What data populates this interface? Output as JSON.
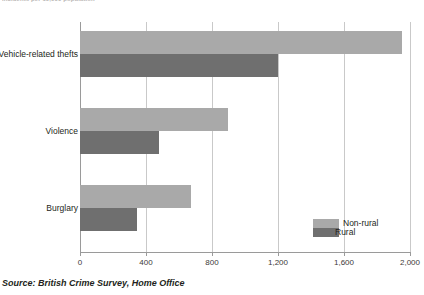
{
  "top_caption": "Incidents per 10,000 population",
  "source": "Source: British Crime Survey, Home Office",
  "legend": {
    "nonrural_label": "Non-rural",
    "rural_label": "Rural",
    "nonrural_color": "#a9a9a9",
    "rural_color": "#6f6f6f"
  },
  "axis": {
    "ticks": [
      "0",
      "400",
      "800",
      "1,200",
      "1,600",
      "2,000"
    ]
  },
  "chart_data": {
    "type": "bar",
    "orientation": "horizontal",
    "title": "",
    "subtitle": "",
    "xlabel": "",
    "ylabel": "",
    "xlim": [
      0,
      2000
    ],
    "xticks": [
      0,
      400,
      800,
      1200,
      1600,
      2000
    ],
    "xticklabels": [
      "0",
      "400",
      "800",
      "1,200",
      "1,600",
      "2,000"
    ],
    "grid": true,
    "legend_position": "inside-bottom-right",
    "categories": [
      "Vehicle-related thefts",
      "Violence",
      "Burglary"
    ],
    "series": [
      {
        "name": "Non-rural",
        "color": "#a9a9a9",
        "values": [
          1950,
          895,
          670
        ]
      },
      {
        "name": "Rural",
        "color": "#6f6f6f",
        "values": [
          1200,
          480,
          345
        ]
      }
    ],
    "annotations": [],
    "source": "Source: British Crime Survey, Home Office"
  }
}
